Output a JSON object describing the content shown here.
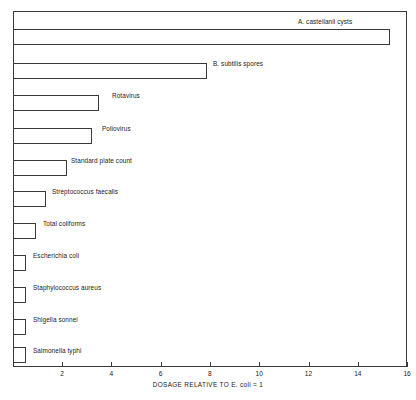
{
  "chart_data": {
    "type": "bar",
    "orientation": "horizontal",
    "title": "",
    "xlabel": "DOSAGE RELATIVE TO E. coli = 1",
    "ylabel": "",
    "xlim": [
      0,
      16
    ],
    "xticks": [
      2,
      4,
      6,
      8,
      10,
      12,
      14,
      16
    ],
    "xtick_labels": [
      "2",
      "4",
      "6",
      "8",
      "10",
      "12",
      "14",
      "16"
    ],
    "grid": false,
    "legend": "none",
    "categories": [
      "A. castellanii cysts",
      "B. subtilis spores",
      "Rotavirus",
      "Poliovirus",
      "Standard plate count",
      "Streptococcus faecalis",
      "Total coliforms",
      "Escherichia coli",
      "Staphylococcus aureus",
      "Shigella sonnei",
      "Salmonella typhi"
    ],
    "values": [
      15.3,
      7.9,
      3.5,
      3.2,
      2.2,
      1.35,
      0.95,
      0.55,
      0.55,
      0.55,
      0.55
    ],
    "bars": [
      {
        "label": "A. castellanii cysts",
        "value": 15.3,
        "label_x": 298,
        "label_y": 18,
        "bar_top": 29
      },
      {
        "label": "B. subtilis spores",
        "value": 7.9,
        "label_x": 213,
        "label_y": 60,
        "bar_top": 63
      },
      {
        "label": "Rotavirus",
        "value": 3.5,
        "label_x": 112,
        "label_y": 92,
        "bar_top": 95
      },
      {
        "label": "Poliovirus",
        "value": 3.2,
        "label_x": 102,
        "label_y": 125,
        "bar_top": 128
      },
      {
        "label": "Standard plate count",
        "value": 2.2,
        "label_x": 71,
        "label_y": 157,
        "bar_top": 160
      },
      {
        "label": "Streptococcus faecalis",
        "value": 1.35,
        "label_x": 52,
        "label_y": 188,
        "bar_top": 191
      },
      {
        "label": "Total coliforms",
        "value": 0.95,
        "label_x": 43,
        "label_y": 220,
        "bar_top": 223
      },
      {
        "label": "Escherichia coli",
        "value": 0.55,
        "label_x": 33,
        "label_y": 252,
        "bar_top": 255
      },
      {
        "label": "Staphylococcus aureus",
        "value": 0.55,
        "label_x": 33,
        "label_y": 284,
        "bar_top": 287
      },
      {
        "label": "Shigella sonnei",
        "value": 0.55,
        "label_x": 33,
        "label_y": 316,
        "bar_top": 319
      },
      {
        "label": "Salmonella typhi",
        "value": 0.55,
        "label_x": 33,
        "label_y": 347,
        "bar_top": 347
      }
    ],
    "colors": {
      "bar_fill": "#ffffff",
      "bar_stroke": "#3a3a3a",
      "axis": "#3a3a3a",
      "text": "#1a1a1a",
      "background": "#ffffff"
    },
    "geometry": {
      "origin_x": 12.7,
      "px_per_unit": 24.65,
      "bar_height": 16
    }
  }
}
